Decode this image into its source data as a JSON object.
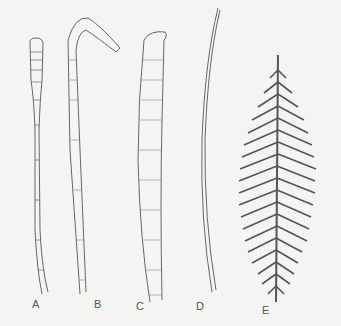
{
  "figure": {
    "specimens": [
      {
        "label": "A",
        "description": "narrow stalk with rounded segmented club tip"
      },
      {
        "label": "B",
        "description": "segmented stalk with hooked tapering tip"
      },
      {
        "label": "C",
        "description": "broad segmented stalk with curled tip"
      },
      {
        "label": "D",
        "description": "thin tapering filament"
      },
      {
        "label": "E",
        "description": "feather-like pinnate frond with central axis"
      }
    ]
  }
}
